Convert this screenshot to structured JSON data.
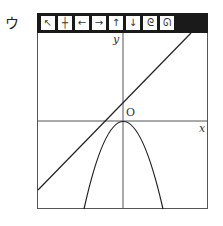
{
  "label": "ウ",
  "toolbar": {
    "buttons": [
      {
        "name": "pointer",
        "glyph": "↖"
      },
      {
        "name": "grid",
        "glyph": "┼"
      },
      {
        "name": "left",
        "glyph": "←"
      },
      {
        "name": "right",
        "glyph": "→"
      },
      {
        "name": "up",
        "glyph": "↑"
      },
      {
        "name": "down",
        "glyph": "↓"
      },
      {
        "name": "zoom-in",
        "glyph": "ᘓ"
      },
      {
        "name": "zoom-out",
        "glyph": "ᘏ"
      }
    ]
  },
  "axes": {
    "x_label": "x",
    "y_label": "y",
    "origin_label": "O"
  },
  "colors": {
    "toolbar_bg": "#1a1a1a",
    "line": "#222222"
  }
}
